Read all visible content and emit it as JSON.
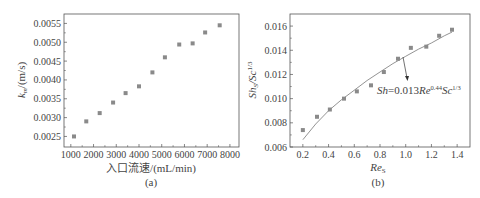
{
  "chart_data": [
    {
      "type": "scatter",
      "panel_label": "(a)",
      "title": "",
      "xlabel": "入口流速/(mL/min)",
      "ylabel": "k_m/(m/s)",
      "ylabel_main": "k",
      "ylabel_sub": "m",
      "ylabel_unit": "/(m/s)",
      "xlim": [
        700,
        8400
      ],
      "ylim": [
        0.00222,
        0.00575
      ],
      "x_ticks": [
        1000,
        2000,
        3000,
        4000,
        5000,
        6000,
        7000,
        8000
      ],
      "x_tick_labels": [
        "1000",
        "2000",
        "3000",
        "4000",
        "5000",
        "6000",
        "7000",
        "8000"
      ],
      "y_ticks": [
        0.0025,
        0.003,
        0.0035,
        0.004,
        0.0045,
        0.005,
        0.0055
      ],
      "y_tick_labels": [
        "0.0025",
        "0.0030",
        "0.0035",
        "0.0040",
        "0.0045",
        "0.0050",
        "0.0055"
      ],
      "grid": false,
      "series": [
        {
          "name": "k_m",
          "marker": "square",
          "color": "#8a8a8a",
          "x": [
            1140,
            1680,
            2270,
            2860,
            3410,
            4000,
            4590,
            5140,
            5770,
            6360,
            6910,
            7550
          ],
          "y": [
            0.0025,
            0.0029,
            0.00312,
            0.0034,
            0.00365,
            0.00383,
            0.0042,
            0.0046,
            0.00494,
            0.00497,
            0.00526,
            0.00545
          ]
        }
      ]
    },
    {
      "type": "scatter",
      "panel_label": "(b)",
      "title": "",
      "xlabel": "Re_S",
      "xlabel_main": "Re",
      "xlabel_sub": "S",
      "ylabel": "Sh_S/Sc^1/3",
      "xlim": [
        0.1,
        1.5
      ],
      "ylim": [
        0.006,
        0.017
      ],
      "x_ticks": [
        0.2,
        0.4,
        0.6,
        0.8,
        1.0,
        1.2,
        1.4
      ],
      "x_tick_labels": [
        "0.2",
        "0.4",
        "0.6",
        "0.8",
        "1.0",
        "1.2",
        "1.4"
      ],
      "y_ticks": [
        0.006,
        0.008,
        0.01,
        0.012,
        0.014,
        0.016
      ],
      "y_tick_labels": [
        "0.006",
        "0.008",
        "0.010",
        "0.012",
        "0.014",
        "0.016"
      ],
      "grid": false,
      "series": [
        {
          "name": "measured",
          "marker": "square",
          "color": "#8a8a8a",
          "x": [
            0.2,
            0.31,
            0.41,
            0.52,
            0.62,
            0.73,
            0.83,
            0.94,
            1.04,
            1.16,
            1.26,
            1.36
          ],
          "y": [
            0.0074,
            0.0085,
            0.0091,
            0.01,
            0.0106,
            0.0111,
            0.0122,
            0.0133,
            0.0142,
            0.0143,
            0.0152,
            0.0157
          ]
        },
        {
          "name": "fit",
          "type": "line",
          "color": "#666666",
          "equation": "Sh=0.013Re^0.44Sc^1/3",
          "x": [
            0.2,
            0.3,
            0.4,
            0.5,
            0.6,
            0.7,
            0.8,
            0.9,
            1.0,
            1.1,
            1.2,
            1.3,
            1.36
          ],
          "y": [
            0.0066,
            0.0079,
            0.009,
            0.0099,
            0.0107,
            0.0115,
            0.0122,
            0.0129,
            0.0135,
            0.0141,
            0.0146,
            0.0152,
            0.0155
          ]
        }
      ],
      "annotation": {
        "text_main": "Sh",
        "text_eq": "=0.013",
        "text_re": "Re",
        "text_re_exp": "0.44",
        "text_sc": "Sc",
        "text_sc_exp": "1/3"
      }
    }
  ]
}
